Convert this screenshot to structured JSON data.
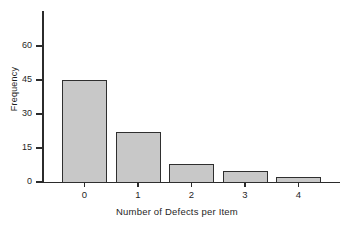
{
  "chart_data": {
    "type": "bar",
    "title": "",
    "categories": [
      "0",
      "1",
      "2",
      "3",
      "4"
    ],
    "values": [
      45,
      22,
      8,
      5,
      2
    ],
    "xlabel": "Number of Defects per Item",
    "ylabel": "Frequency",
    "ylim": [
      0,
      75
    ],
    "yticks": [
      0,
      15,
      30,
      45,
      60
    ],
    "ytick_labels": [
      "0",
      "15",
      "30",
      "45",
      "60"
    ],
    "grid": false,
    "legend": null,
    "series": [
      {
        "name": "Frequency",
        "values": [
          45,
          22,
          8,
          5,
          2
        ]
      }
    ],
    "style": {
      "bar_fill": "#c8c8c8",
      "bar_edge": "#2f2f2f",
      "axis_color": "#2b2b2b",
      "background": "#ffffff",
      "text_color": "#1f1f1f"
    }
  }
}
